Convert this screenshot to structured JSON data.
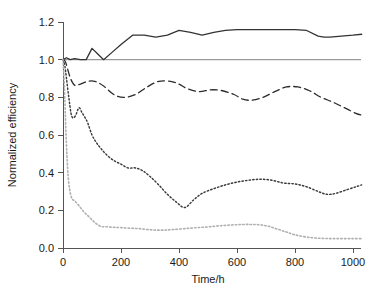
{
  "chart_data": {
    "type": "line",
    "title": "",
    "xlabel": "Time/h",
    "ylabel": "Normalized efficiency",
    "xlim": [
      0,
      1040
    ],
    "ylim": [
      0.0,
      1.2
    ],
    "xticks": [
      0,
      200,
      400,
      600,
      800,
      1000
    ],
    "xticklabels": [
      "0",
      "200",
      "400",
      "600",
      "800",
      "1000"
    ],
    "yticks": [
      0.0,
      0.2,
      0.4,
      0.6,
      0.8,
      1.0,
      1.2
    ],
    "yticklabels": [
      "0.0",
      "0.2",
      "0.4",
      "0.6",
      "0.8",
      "1.0",
      "1.2"
    ],
    "grid": false,
    "legend": "none",
    "reference_line": {
      "name": "normalized-baseline",
      "orientation": "horizontal",
      "y": 1.0,
      "color": "#9a9a9a"
    },
    "series": [
      {
        "name": "solid-series",
        "style": "solid",
        "color": "#333333",
        "width": 1.3,
        "x": [
          0,
          12,
          25,
          40,
          60,
          80,
          100,
          120,
          140,
          170,
          200,
          240,
          280,
          320,
          360,
          400,
          440,
          480,
          520,
          560,
          600,
          640,
          680,
          720,
          760,
          800,
          840,
          880,
          900,
          920,
          960,
          1000,
          1030
        ],
        "y": [
          1.0,
          1.01,
          1.0,
          1.005,
          1.0,
          1.0,
          1.06,
          1.03,
          1.0,
          1.04,
          1.08,
          1.13,
          1.13,
          1.12,
          1.13,
          1.155,
          1.145,
          1.13,
          1.145,
          1.155,
          1.16,
          1.16,
          1.16,
          1.16,
          1.16,
          1.16,
          1.155,
          1.125,
          1.12,
          1.12,
          1.125,
          1.13,
          1.135
        ]
      },
      {
        "name": "dashed-series",
        "style": "dashed",
        "color": "#2b2b2b",
        "width": 1.3,
        "dash": "7,4",
        "x": [
          0,
          8,
          16,
          26,
          40,
          60,
          85,
          110,
          140,
          175,
          210,
          250,
          290,
          330,
          370,
          400,
          430,
          470,
          510,
          550,
          590,
          620,
          650,
          690,
          730,
          770,
          810,
          850,
          890,
          930,
          970,
          1010,
          1030
        ],
        "y": [
          1.0,
          0.99,
          0.95,
          0.9,
          0.865,
          0.87,
          0.885,
          0.885,
          0.86,
          0.815,
          0.8,
          0.815,
          0.855,
          0.885,
          0.885,
          0.87,
          0.845,
          0.83,
          0.84,
          0.835,
          0.815,
          0.79,
          0.785,
          0.8,
          0.83,
          0.855,
          0.855,
          0.835,
          0.8,
          0.775,
          0.745,
          0.715,
          0.705
        ]
      },
      {
        "name": "dotted-series",
        "style": "dotted",
        "color": "#3a3a3a",
        "width": 1.45,
        "dash": "1.4,2.2",
        "x": [
          0,
          6,
          12,
          20,
          30,
          42,
          55,
          65,
          75,
          85,
          100,
          115,
          130,
          150,
          175,
          200,
          225,
          250,
          275,
          300,
          330,
          360,
          390,
          420,
          450,
          480,
          520,
          560,
          600,
          640,
          680,
          720,
          760,
          800,
          840,
          880,
          910,
          940,
          980,
          1010,
          1030
        ],
        "y": [
          1.0,
          0.97,
          0.9,
          0.8,
          0.7,
          0.7,
          0.745,
          0.72,
          0.695,
          0.665,
          0.6,
          0.56,
          0.53,
          0.495,
          0.465,
          0.445,
          0.425,
          0.425,
          0.41,
          0.38,
          0.335,
          0.285,
          0.245,
          0.215,
          0.255,
          0.29,
          0.315,
          0.335,
          0.35,
          0.36,
          0.365,
          0.36,
          0.345,
          0.34,
          0.325,
          0.3,
          0.285,
          0.29,
          0.31,
          0.325,
          0.335
        ]
      },
      {
        "name": "gray-dotted-series",
        "style": "dotted",
        "color": "#b0b0b0",
        "width": 1.6,
        "dash": "1.5,2.2",
        "x": [
          0,
          5,
          10,
          16,
          22,
          30,
          40,
          55,
          70,
          90,
          110,
          130,
          150,
          175,
          200,
          230,
          260,
          290,
          320,
          350,
          380,
          420,
          460,
          500,
          540,
          580,
          620,
          650,
          680,
          710,
          740,
          770,
          800,
          840,
          880,
          920,
          960,
          1000,
          1030
        ],
        "y": [
          1.0,
          0.85,
          0.62,
          0.42,
          0.32,
          0.265,
          0.25,
          0.225,
          0.195,
          0.165,
          0.135,
          0.115,
          0.113,
          0.11,
          0.108,
          0.105,
          0.103,
          0.098,
          0.095,
          0.095,
          0.098,
          0.103,
          0.108,
          0.112,
          0.118,
          0.122,
          0.125,
          0.125,
          0.123,
          0.115,
          0.1,
          0.085,
          0.07,
          0.058,
          0.052,
          0.05,
          0.05,
          0.05,
          0.05
        ]
      }
    ]
  }
}
